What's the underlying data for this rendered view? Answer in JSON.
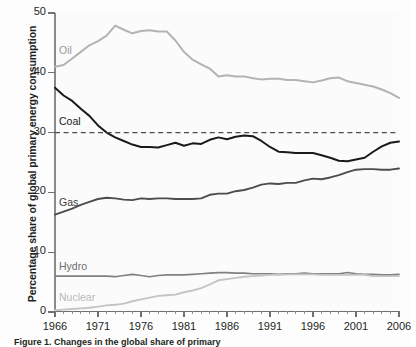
{
  "figure": {
    "caption": "Figure 1.  Changes in the global share of primary"
  },
  "axes": {
    "ylabel": "Percentage share of global primary energy consumption",
    "yticks": [
      0,
      10,
      20,
      30,
      40,
      50
    ],
    "ylim": [
      0,
      50
    ],
    "xticks": [
      1966,
      1971,
      1976,
      1981,
      1986,
      1991,
      1996,
      2001,
      2006
    ],
    "xlim": [
      1966,
      2006
    ],
    "xlabel": ""
  },
  "reference_line": {
    "value": 30,
    "style": "dashed",
    "color": "#4d4d4d"
  },
  "labels": {
    "oil": "Oil",
    "coal": "Coal",
    "gas": "Gas",
    "hydro": "Hydro",
    "nuclear": "Nuclear"
  },
  "colors": {
    "oil": "#b3b3b3",
    "coal": "#1a1a1a",
    "gas": "#4d4d4d",
    "hydro": "#808080",
    "nuclear": "#c4c4c4",
    "background": "#fbfbfb",
    "axis": "#6f6f6f"
  },
  "chart_data": {
    "type": "line",
    "title": "",
    "xlabel": "",
    "ylabel": "Percentage share of global primary energy consumption",
    "xlim": [
      1966,
      2006
    ],
    "ylim": [
      0,
      50
    ],
    "grid": false,
    "legend": "inline-labels",
    "x": [
      1966,
      1967,
      1968,
      1969,
      1970,
      1971,
      1972,
      1973,
      1974,
      1975,
      1976,
      1977,
      1978,
      1979,
      1980,
      1981,
      1982,
      1983,
      1984,
      1985,
      1986,
      1987,
      1988,
      1989,
      1990,
      1991,
      1992,
      1993,
      1994,
      1995,
      1996,
      1997,
      1998,
      1999,
      2000,
      2001,
      2002,
      2003,
      2004,
      2005,
      2006
    ],
    "series": [
      {
        "name": "Oil",
        "color": "#b3b3b3",
        "values": [
          41.0,
          41.3,
          42.4,
          43.5,
          44.6,
          45.3,
          46.2,
          47.9,
          47.2,
          46.6,
          47.0,
          47.1,
          46.9,
          46.9,
          45.4,
          43.5,
          42.2,
          41.4,
          40.7,
          39.4,
          39.6,
          39.4,
          39.4,
          39.1,
          38.9,
          39.0,
          39.0,
          38.8,
          38.8,
          38.6,
          38.4,
          38.7,
          39.1,
          39.2,
          38.6,
          38.3,
          38.0,
          37.7,
          37.2,
          36.6,
          35.8
        ]
      },
      {
        "name": "Coal",
        "color": "#1a1a1a",
        "values": [
          37.5,
          36.2,
          35.3,
          34.0,
          32.8,
          31.2,
          30.0,
          29.2,
          28.6,
          28.0,
          27.6,
          27.6,
          27.5,
          27.9,
          28.3,
          27.8,
          28.2,
          28.1,
          28.8,
          29.2,
          28.9,
          29.3,
          29.5,
          29.4,
          28.6,
          27.6,
          26.8,
          26.7,
          26.6,
          26.6,
          26.6,
          26.2,
          25.8,
          25.3,
          25.2,
          25.5,
          25.8,
          26.8,
          27.7,
          28.3,
          28.5
        ]
      },
      {
        "name": "Gas",
        "color": "#4d4d4d",
        "values": [
          16.3,
          16.8,
          17.3,
          17.9,
          18.4,
          18.9,
          19.1,
          19.0,
          18.8,
          18.7,
          19.0,
          18.9,
          19.0,
          19.0,
          18.9,
          18.9,
          18.9,
          19.0,
          19.6,
          19.8,
          19.8,
          20.2,
          20.4,
          20.8,
          21.3,
          21.5,
          21.4,
          21.6,
          21.6,
          22.0,
          22.3,
          22.2,
          22.5,
          22.9,
          23.4,
          23.8,
          23.9,
          23.9,
          23.8,
          23.8,
          24.0
        ]
      },
      {
        "name": "Hydro",
        "color": "#808080",
        "values": [
          6.0,
          6.0,
          6.0,
          6.0,
          6.0,
          6.0,
          6.0,
          5.9,
          6.1,
          6.3,
          6.1,
          5.9,
          6.1,
          6.2,
          6.2,
          6.2,
          6.3,
          6.4,
          6.5,
          6.6,
          6.6,
          6.5,
          6.5,
          6.4,
          6.4,
          6.4,
          6.3,
          6.4,
          6.4,
          6.5,
          6.4,
          6.4,
          6.4,
          6.4,
          6.6,
          6.4,
          6.3,
          6.3,
          6.2,
          6.2,
          6.3
        ]
      },
      {
        "name": "Nuclear",
        "color": "#c4c4c4",
        "values": [
          0.3,
          0.4,
          0.5,
          0.6,
          0.7,
          0.9,
          1.1,
          1.2,
          1.4,
          1.8,
          2.1,
          2.4,
          2.7,
          2.8,
          2.9,
          3.3,
          3.6,
          4.0,
          4.6,
          5.3,
          5.5,
          5.7,
          5.9,
          6.0,
          6.1,
          6.2,
          6.2,
          6.3,
          6.3,
          6.3,
          6.3,
          6.2,
          6.2,
          6.2,
          6.2,
          6.2,
          6.2,
          6.0,
          6.0,
          6.0,
          6.0
        ]
      }
    ]
  }
}
